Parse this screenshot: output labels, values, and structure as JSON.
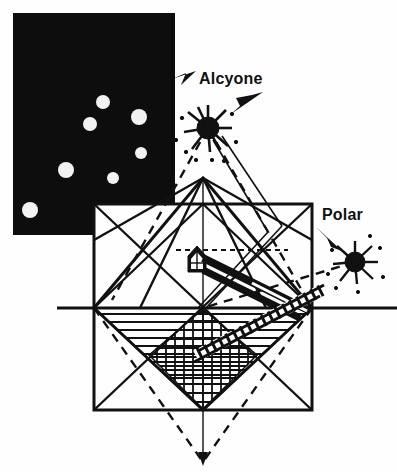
{
  "figure": {
    "kind": "astronomical-alignment-diagram",
    "background_color": "#ffffff",
    "ink_color": "#111111",
    "width": 397,
    "height": 472
  },
  "photo_inset": {
    "name": "pleiades-star-field",
    "fill_color": "#0d0d0d",
    "star_color": "#f2f2f2",
    "rect": {
      "x": 13,
      "y": 13,
      "w": 162,
      "h": 222
    },
    "notch": {
      "x": 94,
      "y": 204,
      "w": 81,
      "h": 31
    },
    "stars": [
      {
        "cx": 103,
        "cy": 102,
        "r": 7
      },
      {
        "cx": 139,
        "cy": 117,
        "r": 8
      },
      {
        "cx": 90,
        "cy": 124,
        "r": 7
      },
      {
        "cx": 141,
        "cy": 153,
        "r": 6
      },
      {
        "cx": 66,
        "cy": 170,
        "r": 8
      },
      {
        "cx": 113,
        "cy": 178,
        "r": 6
      },
      {
        "cx": 30,
        "cy": 210,
        "r": 8
      }
    ]
  },
  "labels": {
    "alcyone": "Alcyone",
    "polar": "Polar"
  },
  "starbursts": [
    {
      "name": "alcyone-starburst",
      "cx": 208,
      "cy": 128,
      "r": 13
    },
    {
      "name": "polar-starburst",
      "cx": 355,
      "cy": 262,
      "r": 12
    }
  ],
  "arrows": [
    {
      "name": "alcyone-arrow-left",
      "x1": 196,
      "y1": 72,
      "x2": 182,
      "y2": 86
    },
    {
      "name": "alcyone-arrow-right",
      "x1": 262,
      "y1": 93,
      "x2": 230,
      "y2": 115
    },
    {
      "name": "polar-arrow",
      "x1": 318,
      "y1": 228,
      "x2": 341,
      "y2": 250
    }
  ],
  "geometry": {
    "square": {
      "x": 94,
      "y": 204,
      "w": 218,
      "h": 206
    },
    "diamond_apex_top": {
      "x": 203,
      "y": 178
    },
    "diamond_apex_bottom": {
      "x": 203,
      "y": 410
    },
    "baseline": {
      "x1": 57,
      "y1": 308,
      "x2": 397,
      "y2": 308
    },
    "vertical_axis": {
      "x": 203,
      "y1": 178,
      "y2": 462
    },
    "dashed_apex": {
      "x": 203,
      "y": 462
    },
    "hatch_horizontal_rows": 9,
    "hatch_grid_pitch": 9
  },
  "chamber": {
    "name": "kings-chamber",
    "x": 188,
    "y": 248,
    "w": 19,
    "h": 22
  },
  "shafts": [
    {
      "name": "upper-shaft",
      "x1": 200,
      "y1": 256,
      "x2": 305,
      "y2": 308,
      "thickness": 7
    },
    {
      "name": "lower-shaft",
      "x1": 200,
      "y1": 268,
      "x2": 300,
      "y2": 318,
      "thickness": 6
    },
    {
      "name": "hatched-descending-passage",
      "x1": 318,
      "y1": 292,
      "x2": 200,
      "y2": 352,
      "thickness": 11
    }
  ]
}
